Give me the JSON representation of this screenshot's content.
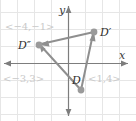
{
  "figure": {
    "width": 136,
    "height": 121,
    "background": "#ffffff"
  },
  "colors": {
    "grid": "#e4e4e4",
    "axis": "#7d7d7d",
    "triangle_stroke": "#8f8f8f",
    "vertex_fill": "#9a9a9a",
    "vector_label": "#c9c9c9",
    "point_label": "#2e2e2e",
    "axis_label": "#3a3a3a"
  },
  "axes": {
    "x_label": "x",
    "y_label": "y",
    "origin_px": {
      "x": 68,
      "y": 63
    },
    "grid_spacing_px": 17,
    "x_axis_y_px": 63,
    "y_axis_x_px": 68,
    "x_arrow_left": true,
    "x_arrow_right": true,
    "y_arrow_up": true,
    "y_arrow_down": true
  },
  "points": [
    {
      "id": "D",
      "label": "D",
      "label_px": {
        "x": 72,
        "y": 84
      },
      "vertex_px": {
        "x": 81,
        "y": 90
      }
    },
    {
      "id": "D-prime",
      "label": "D′",
      "label_px": {
        "x": 100,
        "y": 33
      },
      "vertex_px": {
        "x": 94,
        "y": 32
      }
    },
    {
      "id": "D-double-prime",
      "label": "D″",
      "label_px": {
        "x": 20,
        "y": 46
      },
      "vertex_px": {
        "x": 39,
        "y": 45
      }
    }
  ],
  "vectors": [
    {
      "id": "vector-top-left",
      "label": "<−4,−1>",
      "label_px": {
        "x": 6,
        "y": 29
      },
      "from": "D-prime",
      "to": "D-double-prime"
    },
    {
      "id": "vector-bottom-left",
      "label": "<−3,3>",
      "label_px": {
        "x": 4,
        "y": 80
      },
      "from": "D",
      "to": "D-double-prime"
    },
    {
      "id": "vector-right",
      "label": "<1,4>",
      "label_px": {
        "x": 89,
        "y": 80
      },
      "from": "D",
      "to": "D-prime"
    }
  ],
  "segments": [
    {
      "id": "segment-dprime-to-ddprime",
      "arrowhead_at": "D-double-prime"
    },
    {
      "id": "segment-d-to-ddprime",
      "arrowhead_at": "D-double-prime"
    },
    {
      "id": "segment-d-to-dprime",
      "arrowhead_at": "D-prime"
    }
  ]
}
